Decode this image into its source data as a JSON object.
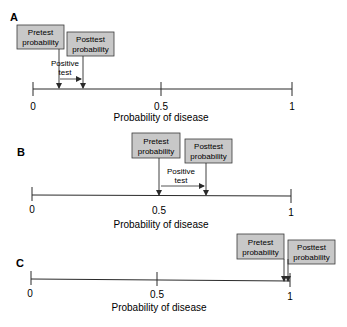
{
  "figure": {
    "axis_label": "Probability of disease",
    "tick_labels": [
      "0",
      "0.5",
      "1"
    ],
    "box_fill": "#c8c8c8",
    "box_stroke": "#3a3a3a",
    "line_color": "#2a2a2a",
    "pretest_label": [
      "Pretest",
      "probability"
    ],
    "posttest_label": [
      "Posttest",
      "probability"
    ],
    "test_label": [
      "Positive",
      "test"
    ]
  },
  "panels": [
    {
      "id": "A",
      "pretest": 0.1,
      "posttest": 0.19,
      "show_test_arrow": true
    },
    {
      "id": "B",
      "pretest": 0.5,
      "posttest": 0.67,
      "show_test_arrow": true
    },
    {
      "id": "C",
      "pretest": 0.98,
      "posttest": 0.99,
      "show_test_arrow": false
    }
  ]
}
